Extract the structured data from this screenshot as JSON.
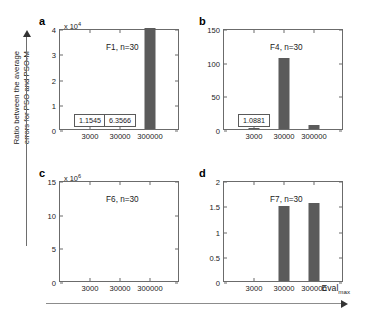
{
  "figure": {
    "ylabel_line1": "Ratio between the average",
    "ylabel_line2": "errors for PSO and PSO-M",
    "xlabel_text": "Eval",
    "xlabel_sub": "max"
  },
  "chart_data": [
    {
      "type": "bar",
      "panel": "a",
      "title": "F1, n=30",
      "multiplier_prefix": "x 10",
      "multiplier_exp": "4",
      "multiplier_value": 10000,
      "categories": [
        "3000",
        "30000",
        "300000"
      ],
      "values": [
        1.1545,
        6.3566,
        40200
      ],
      "ytick_labels": [
        "0",
        "1",
        "2",
        "3",
        "4"
      ],
      "ytick_values": [
        0,
        1,
        2,
        3,
        4
      ],
      "ylim": [
        0,
        4
      ],
      "xlabel": "",
      "ylabel": "",
      "grid": false,
      "legend": null,
      "annotations": [
        {
          "text": "1.1545",
          "category": "3000"
        },
        {
          "text": "6.3566",
          "category": "30000"
        }
      ],
      "bar_color": "#5b5b5b"
    },
    {
      "type": "bar",
      "panel": "b",
      "title": "F4, n=30",
      "multiplier_prefix": "",
      "multiplier_exp": "",
      "multiplier_value": 1,
      "categories": [
        "3000",
        "30000",
        "300000"
      ],
      "values": [
        1.0881,
        106,
        6
      ],
      "ytick_labels": [
        "0",
        "50",
        "100",
        "150"
      ],
      "ytick_values": [
        0,
        50,
        100,
        150
      ],
      "ylim": [
        0,
        150
      ],
      "xlabel": "",
      "ylabel": "",
      "grid": false,
      "legend": null,
      "annotations": [
        {
          "text": "1.0881",
          "category": "3000"
        }
      ],
      "bar_color": "#5b5b5b"
    },
    {
      "type": "bar",
      "panel": "c",
      "title": "F6, n=30",
      "multiplier_prefix": "x 10",
      "multiplier_exp": "6",
      "multiplier_value": 1000000,
      "categories": [
        "3000",
        "30000",
        "300000"
      ],
      "values": [
        0.9,
        10.5,
        0
      ],
      "ytick_labels": [
        "0",
        "5",
        "10",
        "15"
      ],
      "ytick_values": [
        0,
        5,
        10,
        15
      ],
      "ylim": [
        0,
        15
      ],
      "xlabel": "",
      "ylabel": "",
      "grid": false,
      "legend": null,
      "annotations": [],
      "bar_color": "#5b5b5b"
    },
    {
      "type": "bar",
      "panel": "d",
      "title": "F7, n=30",
      "multiplier_prefix": "",
      "multiplier_exp": "",
      "multiplier_value": 1,
      "categories": [
        "3000",
        "30000",
        "300000"
      ],
      "values": [
        0,
        1.48,
        1.55
      ],
      "ytick_labels": [
        "0",
        "0.5",
        "1",
        "1.5",
        "2"
      ],
      "ytick_values": [
        0,
        0.5,
        1,
        1.5,
        2
      ],
      "ylim": [
        0,
        2
      ],
      "xlabel": "",
      "ylabel": "",
      "grid": false,
      "legend": null,
      "annotations": [],
      "bar_color": "#5b5b5b"
    }
  ]
}
